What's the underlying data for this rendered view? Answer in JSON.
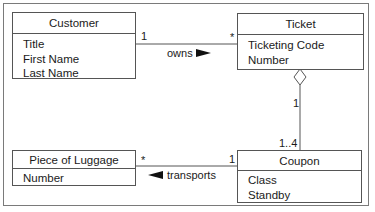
{
  "diagram": {
    "type": "uml-class-diagram",
    "classes": [
      {
        "id": "customer",
        "name": "Customer",
        "attributes": [
          "Title",
          "First Name",
          "Last Name"
        ]
      },
      {
        "id": "ticket",
        "name": "Ticket",
        "attributes": [
          "Ticketing Code",
          "Number"
        ]
      },
      {
        "id": "luggage",
        "name": "Piece of Luggage",
        "attributes": [
          "Number"
        ]
      },
      {
        "id": "coupon",
        "name": "Coupon",
        "attributes": [
          "Class",
          "Standby"
        ]
      }
    ],
    "associations": [
      {
        "name": "owns",
        "from": "Customer",
        "to": "Ticket",
        "from_multiplicity": "1",
        "to_multiplicity": "*",
        "direction_arrow": "right"
      },
      {
        "name": "transports",
        "from": "Coupon",
        "to": "Piece of Luggage",
        "from_multiplicity": "1",
        "to_multiplicity": "*",
        "direction_arrow": "left"
      },
      {
        "name": "",
        "kind": "aggregation",
        "whole": "Ticket",
        "part": "Coupon",
        "whole_multiplicity": "1",
        "part_multiplicity": "1..4"
      }
    ]
  },
  "colors": {
    "line": "#555555",
    "frame": "#7a7a7a",
    "text": "#1a1a1a",
    "arrow": "#111111"
  }
}
